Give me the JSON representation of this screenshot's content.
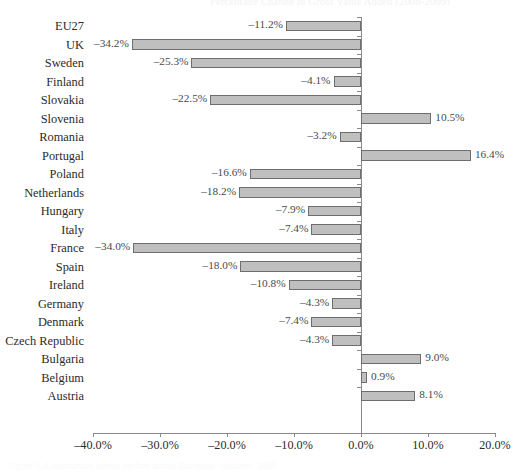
{
  "clipped": {
    "title_fragment": "Percentage Change in Gross Value Added (2008-2009)",
    "caption_fragment": "Figure 3. Construction output decline across European countries, 2009."
  },
  "chart_data": {
    "type": "bar",
    "orientation": "horizontal",
    "title": "",
    "subtitle": "",
    "xlabel": "",
    "ylabel": "",
    "grid": false,
    "legend": null,
    "xlim": [
      -40.0,
      20.0
    ],
    "xticks": [
      -40.0,
      -30.0,
      -20.0,
      -10.0,
      0.0,
      10.0,
      20.0
    ],
    "xtick_labels": [
      "–40.0%",
      "–30.0%",
      "–20.0%",
      "–10.0%",
      "0.0%",
      "10.0%",
      "20.0%"
    ],
    "bar_fill_color": "#bfbfbf",
    "bar_border_color": "#6e6e6e",
    "axis_color": "#8a8a8a",
    "categories": [
      "EU27",
      "UK",
      "Sweden",
      "Finland",
      "Slovakia",
      "Slovenia",
      "Romania",
      "Portugal",
      "Poland",
      "Netherlands",
      "Hungary",
      "Italy",
      "France",
      "Spain",
      "Ireland",
      "Germany",
      "Denmark",
      "Czech Republic",
      "Bulgaria",
      "Belgium",
      "Austria"
    ],
    "values": [
      -11.2,
      -34.2,
      -25.3,
      -4.1,
      -22.5,
      10.5,
      -3.2,
      16.4,
      -16.6,
      -18.2,
      -7.9,
      -7.4,
      -34.0,
      -18.0,
      -10.8,
      -4.3,
      -7.4,
      -4.3,
      9.0,
      0.9,
      8.1
    ],
    "data_labels": [
      "–11.2%",
      "–34.2%",
      "–25.3%",
      "–4.1%",
      "–22.5%",
      "10.5%",
      "–3.2%",
      "16.4%",
      "–16.6%",
      "–18.2%",
      "–7.9%",
      "–7.4%",
      "–34.0%",
      "–18.0%",
      "–10.8%",
      "–4.3%",
      "–7.4%",
      "–4.3%",
      "9.0%",
      "0.9%",
      "8.1%"
    ]
  }
}
